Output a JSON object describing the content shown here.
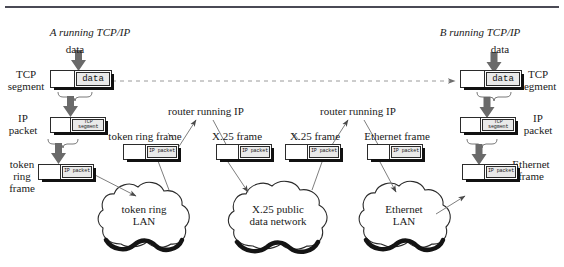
{
  "figure": {
    "kind": "network-protocol-encapsulation-diagram",
    "has_top_rule": true
  },
  "endpoints": {
    "left": {
      "label": "A running TCP/IP",
      "data_label": "data"
    },
    "right": {
      "label": "B running TCP/IP",
      "data_label": "data"
    }
  },
  "left_stack_labels": {
    "tcp_segment": "TCP\nsegment",
    "ip_packet": "IP\npacket",
    "frame": "token\nring\nframe"
  },
  "right_stack_labels": {
    "tcp_segment": "TCP\nsegment",
    "ip_packet": "IP\npacket",
    "frame": "Ethernet\nframe"
  },
  "pdus": {
    "left_tcp": {
      "payload": "data"
    },
    "left_ip": {
      "payload": "TCP\nsegment"
    },
    "left_frame": {
      "payload": "IP\npacket"
    },
    "tr_frame_router": {
      "payload": "IP\npacket"
    },
    "x25_frame_left": {
      "payload": "IP\npacket"
    },
    "x25_frame_right": {
      "payload": "IP\npacket"
    },
    "eth_frame_router": {
      "payload": "IP\npacket"
    },
    "right_frame": {
      "payload": "IP\npacket"
    },
    "right_ip": {
      "payload": "TCP\nsegment"
    },
    "right_tcp": {
      "payload": "data"
    }
  },
  "frame_labels": {
    "token_ring_frame": "token ring frame",
    "x25_frame_left": "X.25 frame",
    "x25_frame_right": "X.25 frame",
    "ethernet_frame": "Ethernet frame"
  },
  "routers": [
    {
      "label": "router running IP"
    },
    {
      "label": "router running IP"
    },
    {
      "label": "router running IP"
    }
  ],
  "networks": [
    {
      "label": "token ring\nLAN",
      "name": "token-ring-lan"
    },
    {
      "label": "X.25 public\ndata network",
      "name": "x25-public-data-network"
    },
    {
      "label": "Ethernet\nLAN",
      "name": "ethernet-lan"
    }
  ],
  "colors": {
    "ink": "#1a1a1a",
    "line": "#2b2b2b",
    "payload_fill": "#e9e9e9",
    "shadow": "#111111",
    "rule": "#4a4a55",
    "background": "#ffffff",
    "dashed_link": "#9a9a9a"
  },
  "connections": {
    "virtual_link_style": "dashed",
    "virtual_link_desc": "dashed TCP virtual connection from A to B"
  }
}
